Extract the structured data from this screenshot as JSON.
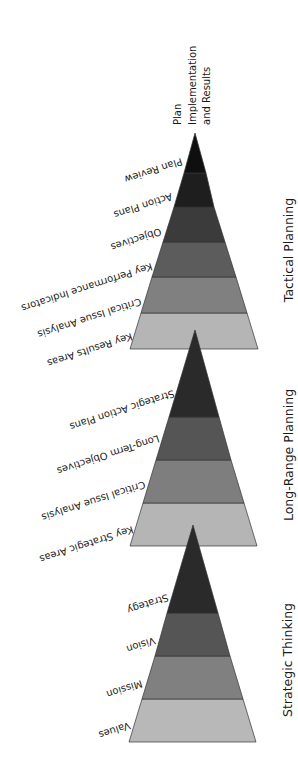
{
  "diagram": {
    "type": "stacked-pyramids",
    "orientation": "rotated; labels read upside-down along left edges",
    "top_note": {
      "lines": [
        "Plan",
        "Implementation",
        "and Results"
      ]
    },
    "pyramids": [
      {
        "title": "Tactical Planning",
        "levels_base_to_apex": [
          "Key Results Areas",
          "Critical Issue Analysis",
          "Key Performance Indicators",
          "Objectives",
          "Action Plans",
          "Plan Review"
        ],
        "colors_base_to_apex": [
          "#b5b5b5",
          "#808080",
          "#5c5c5c",
          "#3b3b3b",
          "#1e1e1e",
          "#0f0f0f"
        ]
      },
      {
        "title": "Long-Range Planning",
        "levels_base_to_apex": [
          "Key Strategic Areas",
          "Critical Issue Analysis",
          "Long-Term Objectives",
          "Strategic Action Plans"
        ],
        "colors_base_to_apex": [
          "#b5b5b5",
          "#7e7e7e",
          "#555555",
          "#2a2a2a"
        ]
      },
      {
        "title": "Strategic Thinking",
        "levels_base_to_apex": [
          "Values",
          "Mission",
          "Vision",
          "Strategy"
        ],
        "colors_base_to_apex": [
          "#b8b8b8",
          "#808080",
          "#555555",
          "#2a2a2a"
        ]
      }
    ]
  }
}
